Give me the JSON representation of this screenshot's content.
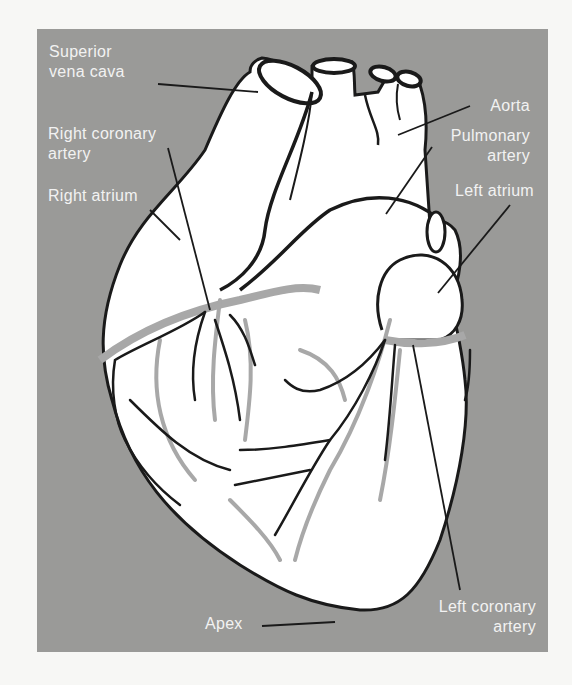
{
  "diagram": {
    "colors": {
      "background": "#f7f7f5",
      "panel": "#9a9a98",
      "heart_fill": "#ffffff",
      "outline": "#1a1a1a",
      "vessel_gray": "#a8a8a8",
      "label_text": "#f2f2f2"
    },
    "labels": [
      {
        "id": "superior-vena-cava",
        "lines": [
          "Superior",
          "vena cava"
        ]
      },
      {
        "id": "right-coronary-artery",
        "lines": [
          "Right coronary",
          "artery"
        ]
      },
      {
        "id": "right-atrium",
        "lines": [
          "Right atrium"
        ]
      },
      {
        "id": "aorta",
        "lines": [
          "Aorta"
        ]
      },
      {
        "id": "pulmonary-artery",
        "lines": [
          "Pulmonary",
          "artery"
        ]
      },
      {
        "id": "left-atrium",
        "lines": [
          "Left atrium"
        ]
      },
      {
        "id": "apex",
        "lines": [
          "Apex"
        ]
      },
      {
        "id": "left-coronary-artery",
        "lines": [
          "Left coronary",
          "artery"
        ]
      }
    ]
  }
}
